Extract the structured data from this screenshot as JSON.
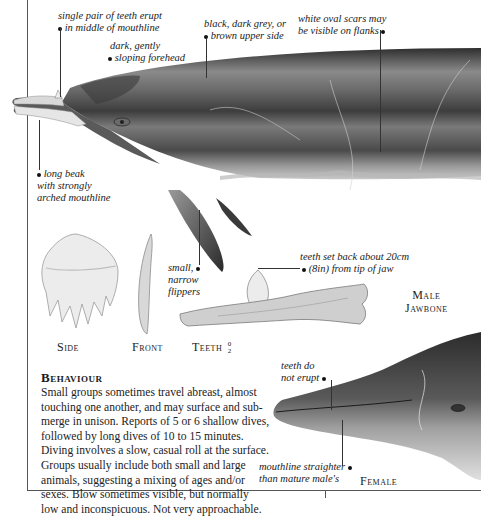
{
  "whale_labels": {
    "teeth_erupt": [
      "single pair of teeth erupt",
      "in middle of mouthline"
    ],
    "forehead": [
      "dark, gently",
      "sloping forehead"
    ],
    "upper_side": [
      "black, dark grey, or",
      "brown upper side"
    ],
    "scars": [
      "white oval scars may",
      "be visible on flanks"
    ],
    "beak": [
      "long beak",
      "with strongly",
      "arched mouthline"
    ],
    "flippers": [
      "small,",
      "narrow",
      "flippers"
    ]
  },
  "tooth_views": {
    "side_label": "Side",
    "front_label": "Front",
    "teeth_label": "Teeth",
    "teeth_upper": "0",
    "teeth_lower": "2"
  },
  "jawbone": {
    "note": [
      "teeth set back about 20cm",
      "(8in) from tip of jaw"
    ],
    "label_line1": "Male",
    "label_line2": "Jawbone"
  },
  "female": {
    "teeth_note": [
      "teeth do",
      "not erupt"
    ],
    "mouthline_note": [
      "mouthline straighter",
      "than mature male's"
    ],
    "label": "Female"
  },
  "behaviour": {
    "heading": "Behaviour",
    "lines": [
      "Small groups sometimes travel abreast, almost",
      "touching one another, and may surface and sub-",
      "merge in unison. Reports of 5 or 6 shallow dives,",
      "followed by long dives of 10 to 15 minutes.",
      "Diving involves a slow, casual roll at the surface.",
      "Groups usually include both small and large",
      "animals, suggesting a mixing of ages and/or",
      "sexes. Blow sometimes visible, but normally",
      "low and inconspicuous. Not very approachable."
    ]
  },
  "colors": {
    "whale_dark": "#3c3c3c",
    "whale_mid": "#6e6e6e",
    "whale_light": "#a8a8a8",
    "belly": "#cfcfcf",
    "tooth": "#e8e8e8",
    "frame": "#555555"
  }
}
